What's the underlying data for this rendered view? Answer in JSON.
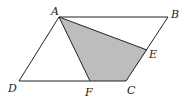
{
  "figure": {
    "type": "geometry-diagram",
    "colors": {
      "line": "#222222",
      "shade": "#bdbdbd",
      "background": "#ffffff"
    },
    "points": {
      "A": {
        "label": "A",
        "x": 59,
        "y": 17,
        "lx": 51,
        "ly": 15
      },
      "B": {
        "label": "B",
        "x": 168,
        "y": 17,
        "lx": 171,
        "ly": 18
      },
      "C": {
        "label": "C",
        "x": 126,
        "y": 81,
        "lx": 127,
        "ly": 94
      },
      "D": {
        "label": "D",
        "x": 19,
        "y": 81,
        "lx": 8,
        "ly": 92
      },
      "E": {
        "label": "E",
        "x": 147,
        "y": 50,
        "lx": 149,
        "ly": 58
      },
      "F": {
        "label": "F",
        "x": 90,
        "y": 81,
        "lx": 85,
        "ly": 96
      }
    },
    "shaded_region": [
      "A",
      "E",
      "C",
      "F"
    ],
    "segments": [
      [
        "A",
        "B"
      ],
      [
        "B",
        "C"
      ],
      [
        "C",
        "D"
      ],
      [
        "D",
        "A"
      ],
      [
        "A",
        "E"
      ],
      [
        "A",
        "F"
      ]
    ]
  }
}
